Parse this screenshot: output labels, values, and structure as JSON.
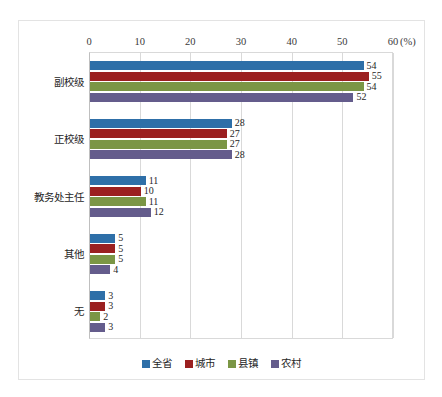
{
  "chart_data": {
    "type": "bar",
    "orientation": "horizontal",
    "title": "",
    "subtitle": "",
    "xlabel": "(%)",
    "ylabel": "",
    "xlim": [
      0,
      60
    ],
    "xticks": [
      0,
      10,
      20,
      30,
      40,
      50,
      60
    ],
    "xtick_labels": [
      "0",
      "10",
      "20",
      "30",
      "40",
      "50",
      "60"
    ],
    "unit_label": "(%)",
    "grid": true,
    "legend_position": "bottom",
    "categories": [
      "副校级",
      "正校级",
      "教务处主任",
      "其他",
      "无"
    ],
    "series": [
      {
        "name": "全省",
        "color": "#2E6FA8",
        "values": [
          54,
          28,
          11,
          5,
          3
        ]
      },
      {
        "name": "城市",
        "color": "#9B2020",
        "values": [
          55,
          27,
          10,
          5,
          3
        ]
      },
      {
        "name": "县镇",
        "color": "#7B9645",
        "values": [
          54,
          27,
          11,
          5,
          2
        ]
      },
      {
        "name": "农村",
        "color": "#645C8C",
        "values": [
          52,
          28,
          12,
          4,
          3
        ]
      }
    ]
  },
  "legend": {
    "items": [
      {
        "label": "全省",
        "color": "#2E6FA8"
      },
      {
        "label": "城市",
        "color": "#9B2020"
      },
      {
        "label": "县镇",
        "color": "#7B9645"
      },
      {
        "label": "农村",
        "color": "#645C8C"
      }
    ]
  }
}
